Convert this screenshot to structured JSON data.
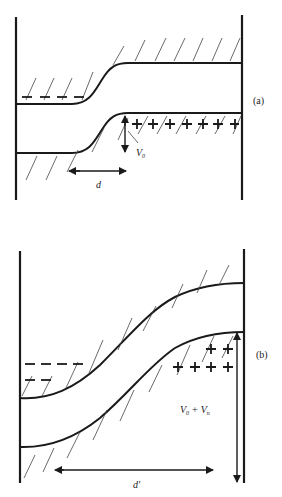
{
  "figure": {
    "panels": [
      {
        "id": "a",
        "label": "(a)",
        "annotations": {
          "voltage": "V",
          "voltage_sub": "0",
          "width": "d"
        },
        "charges": {
          "negative_count": 4,
          "positive_count": 7
        }
      },
      {
        "id": "b",
        "label": "(b)",
        "annotations": {
          "voltage": "V",
          "voltage_sub": "0",
          "voltage_plus": "+",
          "voltage2": "V",
          "voltage2_sub": "n",
          "width": "d′"
        },
        "charges": {
          "negative_count": 5,
          "positive_count": 6
        }
      }
    ]
  }
}
